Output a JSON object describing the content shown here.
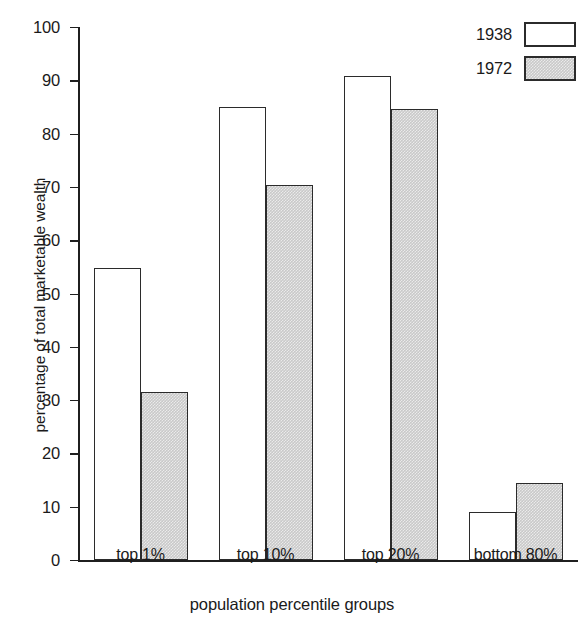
{
  "chart_data": {
    "type": "bar",
    "title": "",
    "subtitle": "",
    "xlabel": "population percentile groups",
    "ylabel": "percentage of total marketable wealth",
    "categories": [
      "top 1%",
      "top 10%",
      "top 20%",
      "bottom 80%"
    ],
    "series": [
      {
        "name": "1938",
        "values": [
          54.7,
          85.0,
          90.8,
          9.0
        ],
        "fill": "white",
        "color": "#ffffff"
      },
      {
        "name": "1972",
        "values": [
          31.6,
          70.3,
          84.6,
          14.5
        ],
        "fill": "gray-stipple",
        "color": "#c9c9c9"
      }
    ],
    "ylim": [
      0,
      100
    ],
    "ytick_values": [
      0,
      10,
      20,
      30,
      40,
      50,
      60,
      70,
      80,
      90,
      100
    ],
    "ytick_labels": [
      "0",
      "10",
      "20",
      "30",
      "40",
      "50",
      "60",
      "70",
      "80",
      "90",
      "100"
    ],
    "grid": false,
    "legend_position": "top-right",
    "axis_color": "#1f1f1f",
    "bar_edge_color": "#2b2b2b",
    "background": "#ffffff"
  },
  "legend": {
    "entries": [
      {
        "label": "1938"
      },
      {
        "label": "1972"
      }
    ]
  }
}
